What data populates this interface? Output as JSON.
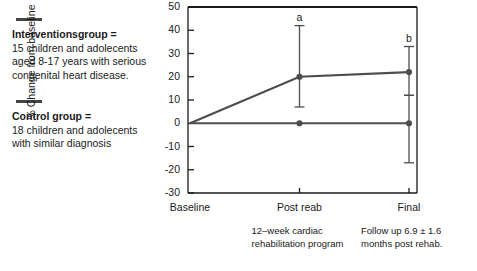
{
  "legend": {
    "entries": [
      {
        "marker": "line-swatch",
        "title": "Interventionsgroup =",
        "description": "15 children and adolecents aged 8-17 years with serious congenital heart disease."
      },
      {
        "marker": "line-swatch",
        "title": "Control group =",
        "description": "18 children and adolecents with similar diagnosis"
      }
    ]
  },
  "chart_data": {
    "type": "line",
    "title": "",
    "xlabel": "",
    "ylabel": "% Change from baseline",
    "categories": [
      "Baseline",
      "Post reab",
      "Final"
    ],
    "ylim": [
      -30,
      50
    ],
    "yticks": [
      50,
      40,
      30,
      20,
      10,
      0,
      -10,
      -20,
      -30
    ],
    "grid": false,
    "legend_position": "left-outside",
    "series": [
      {
        "name": "Interventionsgroup",
        "values": [
          0,
          20,
          22
        ],
        "err_low": [
          0,
          7,
          12
        ],
        "err_high": [
          0,
          42,
          33
        ]
      },
      {
        "name": "Control group",
        "values": [
          0,
          0,
          0
        ],
        "err_low": [
          0,
          0,
          -17
        ],
        "err_high": [
          0,
          0,
          12
        ]
      }
    ],
    "annotations": [
      {
        "text": "a",
        "category": "Post reab"
      },
      {
        "text": "b",
        "category": "Final"
      }
    ],
    "captions": [
      {
        "text": "12–week cardiac rehabilitation program",
        "under": "Post reab"
      },
      {
        "text": "Follow up 6.9 ± 1.6 months post rehab.",
        "under": "Final"
      }
    ],
    "colors": {
      "line": "#4d4d4d",
      "axis": "#1a1a1a",
      "marker": "#4d4d4d"
    }
  }
}
